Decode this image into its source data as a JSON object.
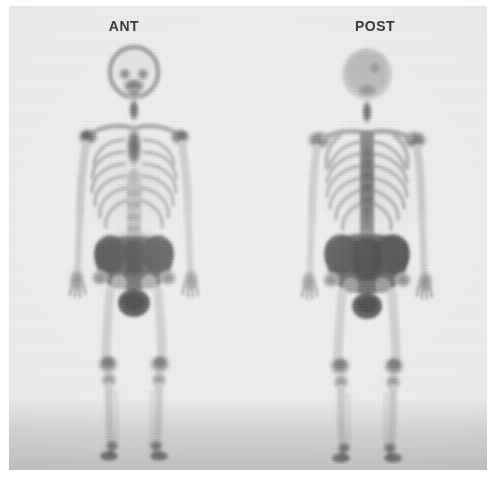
{
  "study": {
    "modality": "bone-scintigraphy",
    "description": "Whole-body bone scan, anterior and posterior projections",
    "background_color": "#ececeb",
    "label_color": "#2a2a2a",
    "max_uptake_color": "#3f3f3f",
    "soft_tissue_color": "#d8d8d6"
  },
  "views": [
    {
      "id": "anterior",
      "label": "ANT",
      "label_center_x": 124,
      "regions": [
        {
          "name": "skull",
          "uptake": "moderate"
        },
        {
          "name": "facial-bones",
          "uptake": "high"
        },
        {
          "name": "cervical-spine",
          "uptake": "high"
        },
        {
          "name": "sternum-manubrium",
          "uptake": "high"
        },
        {
          "name": "clavicles",
          "uptake": "moderate"
        },
        {
          "name": "shoulders",
          "uptake": "high"
        },
        {
          "name": "ribs",
          "uptake": "moderate"
        },
        {
          "name": "thoracolumbar-spine",
          "uptake": "moderate"
        },
        {
          "name": "pelvis",
          "uptake": "very-high"
        },
        {
          "name": "urinary-bladder",
          "uptake": "very-high"
        },
        {
          "name": "femurs",
          "uptake": "low"
        },
        {
          "name": "knees",
          "uptake": "moderate"
        },
        {
          "name": "tibiae",
          "uptake": "low"
        },
        {
          "name": "ankles-feet",
          "uptake": "high"
        },
        {
          "name": "hands",
          "uptake": "moderate"
        }
      ]
    },
    {
      "id": "posterior",
      "label": "POST",
      "label_center_x": 375,
      "regions": [
        {
          "name": "skull",
          "uptake": "moderate"
        },
        {
          "name": "cervical-spine",
          "uptake": "high"
        },
        {
          "name": "scapulae",
          "uptake": "moderate"
        },
        {
          "name": "shoulders",
          "uptake": "high"
        },
        {
          "name": "ribs",
          "uptake": "moderate"
        },
        {
          "name": "thoracic-spine",
          "uptake": "high"
        },
        {
          "name": "lumbar-spine",
          "uptake": "high"
        },
        {
          "name": "sacroiliac-joints",
          "uptake": "very-high"
        },
        {
          "name": "pelvis",
          "uptake": "very-high"
        },
        {
          "name": "urinary-bladder",
          "uptake": "very-high"
        },
        {
          "name": "femurs",
          "uptake": "low"
        },
        {
          "name": "knees",
          "uptake": "moderate"
        },
        {
          "name": "tibiae",
          "uptake": "low"
        },
        {
          "name": "ankles-feet",
          "uptake": "high"
        },
        {
          "name": "hands",
          "uptake": "moderate"
        }
      ]
    }
  ]
}
